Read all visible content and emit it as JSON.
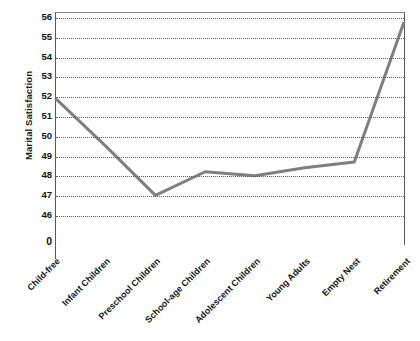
{
  "chart_data": {
    "type": "line",
    "title": "",
    "xlabel": "",
    "ylabel": "Marital Satisfaction",
    "categories": [
      "Child-free",
      "Infant Children",
      "Preschool Children",
      "School-age Children",
      "Adolescent Children",
      "Young Adults",
      "Empty Nest",
      "Retirement"
    ],
    "values": [
      51.9,
      49.5,
      47.0,
      48.2,
      48.0,
      48.4,
      48.7,
      55.8
    ],
    "series": [
      {
        "name": "Marital Satisfaction",
        "values": [
          51.9,
          49.5,
          47.0,
          48.2,
          48.0,
          48.4,
          48.7,
          55.8
        ],
        "color": "#7f7f7f"
      }
    ],
    "ylim": [
      46,
      56
    ],
    "ytick_labels": [
      "56",
      "55",
      "54",
      "53",
      "52",
      "51",
      "50",
      "49",
      "48",
      "47",
      "46",
      "0"
    ],
    "yticks": [
      56,
      55,
      54,
      53,
      52,
      51,
      50,
      49,
      48,
      47,
      46
    ],
    "zero_tick_label": "0",
    "grid": true,
    "grid_style": "dotted",
    "grid_color": "#5f5f5f",
    "legend": "none",
    "line_color": "#7f7f7f",
    "line_width": 3,
    "markers": "none",
    "xlabel_rotation": -45,
    "axis_color": "#5a5a5a",
    "background": "#ffffff"
  }
}
